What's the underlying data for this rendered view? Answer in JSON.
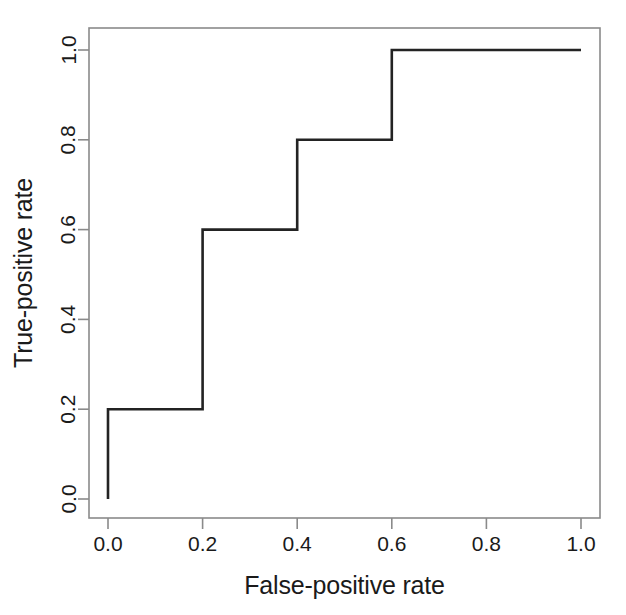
{
  "chart_data": {
    "type": "line",
    "title": "",
    "subtitle": "",
    "xlabel": "False-positive rate",
    "ylabel": "True-positive rate",
    "xlim": [
      0.0,
      1.0
    ],
    "ylim": [
      0.0,
      1.0
    ],
    "grid": false,
    "legend": false,
    "legend_position": "none",
    "step_style": "post",
    "line_color": "#232323",
    "border_color": "#8a8a8a",
    "background_color": "#ffffff",
    "x_ticks": [
      {
        "value": 0.0,
        "label": "0.0"
      },
      {
        "value": 0.2,
        "label": "0.2"
      },
      {
        "value": 0.4,
        "label": "0.4"
      },
      {
        "value": 0.6,
        "label": "0.6"
      },
      {
        "value": 0.8,
        "label": "0.8"
      },
      {
        "value": 1.0,
        "label": "1.0"
      }
    ],
    "y_ticks": [
      {
        "value": 0.0,
        "label": "0.0"
      },
      {
        "value": 0.2,
        "label": "0.2"
      },
      {
        "value": 0.4,
        "label": "0.4"
      },
      {
        "value": 0.6,
        "label": "0.6"
      },
      {
        "value": 0.8,
        "label": "0.8"
      },
      {
        "value": 1.0,
        "label": "1.0"
      }
    ],
    "series": [
      {
        "name": "ROC curve",
        "x": [
          0.0,
          0.0,
          0.2,
          0.2,
          0.4,
          0.4,
          0.6,
          0.6,
          1.0
        ],
        "y": [
          0.0,
          0.2,
          0.2,
          0.6,
          0.6,
          0.8,
          0.8,
          1.0,
          1.0
        ]
      }
    ],
    "points": [
      {
        "fpr": 0.0,
        "tpr": 0.0
      },
      {
        "fpr": 0.0,
        "tpr": 0.2
      },
      {
        "fpr": 0.2,
        "tpr": 0.6
      },
      {
        "fpr": 0.4,
        "tpr": 0.8
      },
      {
        "fpr": 0.6,
        "tpr": 1.0
      },
      {
        "fpr": 1.0,
        "tpr": 1.0
      }
    ]
  }
}
